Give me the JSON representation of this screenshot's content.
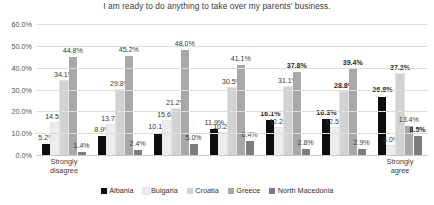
{
  "chart_data": {
    "type": "bar",
    "title": "I am ready to do anything to take over my parents’ business.",
    "xlabel": "",
    "ylabel": "",
    "ylim": [
      0,
      60
    ],
    "ytick_labels": [
      "0.0%",
      "10.0%",
      "20.0%",
      "30.0%",
      "40.0%",
      "50.0%",
      "60.0%"
    ],
    "ytick_values": [
      0,
      10,
      20,
      30,
      40,
      50,
      60
    ],
    "grid": true,
    "legend_position": "bottom",
    "categories": [
      "Strongly\ndisagree",
      "",
      "",
      "",
      "",
      "",
      "Strongly agree"
    ],
    "series": [
      {
        "name": "Albania",
        "color": "#0d0d0d",
        "values": [
          5.2,
          8.9,
          10.1,
          11.9,
          16.1,
          16.3,
          26.8
        ],
        "labels": [
          "5.2%",
          "8.9%",
          "10.1%",
          "11.9%",
          "16.1%",
          "16.3%",
          "26.8%"
        ],
        "bold": [
          false,
          false,
          false,
          false,
          true,
          true,
          true
        ]
      },
      {
        "name": "Bulgaria",
        "color": "#ececec",
        "values": [
          14.5,
          13.7,
          15.6,
          10.2,
          12.2,
          12.5,
          4.0
        ],
        "labels": [
          "14.5%",
          "13.7%",
          "15.6%",
          "10.2%",
          "12.2%",
          "12.5%",
          "4.0%"
        ],
        "bold": [
          false,
          false,
          false,
          false,
          false,
          false,
          false
        ]
      },
      {
        "name": "Croatia",
        "color": "#d2d2d2",
        "values": [
          34.1,
          29.8,
          21.2,
          30.5,
          31.1,
          28.8,
          37.2
        ],
        "labels": [
          "34.1%",
          "29.8%",
          "21.2%",
          "30.5%",
          "31.1%",
          "28.8%",
          "37.2%"
        ],
        "bold": [
          false,
          false,
          false,
          false,
          false,
          true,
          true
        ]
      },
      {
        "name": "Greece",
        "color": "#a8a8a8",
        "values": [
          44.8,
          45.2,
          48.0,
          41.1,
          37.8,
          39.4,
          13.4
        ],
        "labels": [
          "44.8%",
          "45.2%",
          "48.0%",
          "41.1%",
          "37.8%",
          "39.4%",
          "13.4%"
        ],
        "bold": [
          false,
          false,
          false,
          false,
          true,
          true,
          false
        ]
      },
      {
        "name": "North Macedonia",
        "color": "#7d7d7d",
        "values": [
          1.4,
          2.4,
          5.0,
          6.4,
          2.8,
          2.9,
          8.5
        ],
        "labels": [
          "1.4%",
          "2.4%",
          "5.0%",
          "6.4%",
          "2.8%",
          "2.9%",
          "8.5%"
        ],
        "bold": [
          false,
          false,
          false,
          false,
          false,
          false,
          true
        ]
      }
    ]
  }
}
